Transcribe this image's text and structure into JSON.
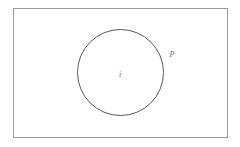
{
  "figure": {
    "type": "set-diagram",
    "background_color": "#ffffff",
    "outer_region": {
      "name": "outer-rectangle",
      "shape": "rectangle",
      "x": 13,
      "y": 8,
      "width": 215,
      "height": 130,
      "fill": "#ffffff",
      "stroke_color": "#9a9a9a",
      "stroke_width": 1
    },
    "inner_region": {
      "name": "inner-circle",
      "shape": "circle",
      "cx": 120.5,
      "cy": 72.5,
      "r": 43,
      "fill": "none",
      "stroke_color": "#5a5a5a",
      "stroke_width": 1
    },
    "labels": [
      {
        "name": "inner-label",
        "text": "i",
        "x": 120,
        "y": 75,
        "style": "italic",
        "color": "#6b6b6b",
        "position": "circle-center"
      },
      {
        "name": "outer-label",
        "text": "P",
        "x": 172,
        "y": 55,
        "style": "italic",
        "color": "#6b6b6b",
        "position": "outside-circle-upper-right"
      }
    ]
  }
}
